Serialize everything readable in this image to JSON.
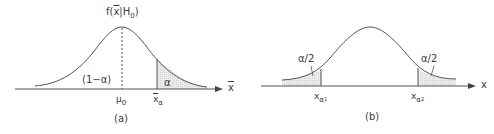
{
  "figure": {
    "panel_a": {
      "caption": "(a)",
      "density_label_prefix": "f(",
      "density_label_var": "x",
      "density_label_mid": "|H",
      "density_label_sub": "0",
      "density_label_suffix": ")",
      "acceptance_region_label": "(1−α)",
      "rejection_region_label": "α",
      "mean_label": "μ",
      "mean_label_sub": "0",
      "critical_value_label": "x",
      "critical_value_sub": "α",
      "axis_label": "x"
    },
    "panel_b": {
      "caption": "(b)",
      "left_tail_label": "α/2",
      "right_tail_label": "α/2",
      "left_critical_label": "x",
      "left_critical_sub": "α",
      "left_critical_subsub": "1",
      "right_critical_label": "x",
      "right_critical_sub": "α",
      "right_critical_subsub": "2",
      "axis_label": "x"
    },
    "colors": {
      "line": "#555555",
      "shade": "#e6e6e6",
      "text": "#3a3a3a"
    }
  }
}
